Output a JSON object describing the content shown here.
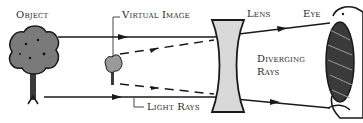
{
  "labels": {
    "object": "Object",
    "virtual_image": "Virtual Image",
    "lens": "Lens",
    "eye": "Eye",
    "diverging_rays_line1": "Diverging",
    "diverging_rays_line2": "Rays",
    "light_rays": "Light Rays"
  },
  "colors": {
    "ink": "#1a1a1a",
    "tree_fill": "#7a7a7a",
    "lens_fill": "#d9d9d9",
    "eye_fill": "#3a3a3a"
  }
}
